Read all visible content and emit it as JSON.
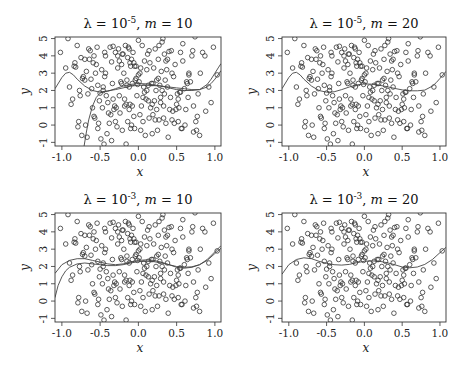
{
  "chart_data": [
    {
      "type": "scatter",
      "title": "λ = 10⁻⁵, m = 10",
      "title_parts": {
        "lambda_exp": "-5",
        "m": "10"
      },
      "xlabel": "x",
      "ylabel": "y",
      "xlim": [
        -1.09,
        1.08
      ],
      "ylim": [
        -1.21,
        5.09
      ],
      "xticks": [
        -1.0,
        -0.5,
        0.0,
        0.5,
        1.0
      ],
      "xtick_labels": [
        "-1.0",
        "-0.5",
        "0.0",
        "0.5",
        "1.0"
      ],
      "yticks": [
        -1,
        0,
        1,
        2,
        3,
        4,
        5
      ],
      "ytick_labels": [
        "-1",
        "0",
        "1",
        "2",
        "3",
        "4",
        "5"
      ],
      "grid": false,
      "curves": [
        {
          "name": "fit-a",
          "x": [
            -1.09,
            -1.0,
            -0.95,
            -0.9,
            -0.85,
            -0.8,
            -0.7,
            -0.6,
            -0.5,
            -0.4,
            -0.3,
            -0.2,
            -0.1,
            0.0,
            0.1,
            0.2,
            0.3,
            0.4,
            0.5,
            0.6,
            0.7,
            0.8,
            0.9,
            0.95,
            1.0,
            1.05,
            1.08
          ],
          "y": [
            2.1,
            2.75,
            3.0,
            3.05,
            2.9,
            2.65,
            2.25,
            2.0,
            1.9,
            1.95,
            2.1,
            2.25,
            2.35,
            2.4,
            2.38,
            2.32,
            2.25,
            2.15,
            2.05,
            2.0,
            2.0,
            2.05,
            2.35,
            2.65,
            3.0,
            3.35,
            3.55
          ]
        },
        {
          "name": "fit-b",
          "x": [
            -0.71,
            -0.68,
            -0.65,
            -0.6,
            -0.55,
            -0.5,
            -0.45,
            -0.4,
            -0.3,
            -0.2,
            -0.1,
            0.0,
            0.1,
            0.2,
            0.3,
            0.4,
            0.5,
            0.6,
            0.7,
            0.8,
            0.9,
            0.95,
            1.0,
            1.05,
            1.08
          ],
          "y": [
            -1.21,
            -0.4,
            0.3,
            1.1,
            1.6,
            1.85,
            1.95,
            1.98,
            2.05,
            2.15,
            2.25,
            2.3,
            2.3,
            2.28,
            2.25,
            2.2,
            2.15,
            2.1,
            2.05,
            2.05,
            2.2,
            2.4,
            2.65,
            2.95,
            3.15
          ]
        }
      ]
    },
    {
      "type": "scatter",
      "title": "λ = 10⁻⁵, m = 20",
      "title_parts": {
        "lambda_exp": "-5",
        "m": "20"
      },
      "xlabel": "x",
      "ylabel": "y",
      "xlim": [
        -1.09,
        1.08
      ],
      "ylim": [
        -1.21,
        5.09
      ],
      "xticks": [
        -1.0,
        -0.5,
        0.0,
        0.5,
        1.0
      ],
      "xtick_labels": [
        "-1.0",
        "-0.5",
        "0.0",
        "0.5",
        "1.0"
      ],
      "yticks": [
        -1,
        0,
        1,
        2,
        3,
        4,
        5
      ],
      "ytick_labels": [
        "-1",
        "0",
        "1",
        "2",
        "3",
        "4",
        "5"
      ],
      "grid": false,
      "curves": [
        {
          "name": "fit",
          "x": [
            -1.09,
            -1.0,
            -0.95,
            -0.9,
            -0.85,
            -0.8,
            -0.7,
            -0.6,
            -0.5,
            -0.4,
            -0.3,
            -0.2,
            -0.1,
            0.0,
            0.1,
            0.2,
            0.3,
            0.4,
            0.5,
            0.6,
            0.7,
            0.8,
            0.9,
            0.95,
            1.0,
            1.05,
            1.08
          ],
          "y": [
            2.1,
            2.75,
            3.0,
            3.05,
            2.9,
            2.65,
            2.25,
            2.0,
            1.9,
            1.92,
            2.05,
            2.2,
            2.32,
            2.38,
            2.36,
            2.3,
            2.22,
            2.12,
            2.03,
            1.98,
            1.98,
            2.02,
            2.25,
            2.45,
            2.7,
            2.95,
            3.1
          ]
        }
      ]
    },
    {
      "type": "scatter",
      "title": "λ = 10⁻³, m = 10",
      "title_parts": {
        "lambda_exp": "-3",
        "m": "10"
      },
      "xlabel": "x",
      "ylabel": "y",
      "xlim": [
        -1.09,
        1.08
      ],
      "ylim": [
        -1.21,
        5.09
      ],
      "xticks": [
        -1.0,
        -0.5,
        0.0,
        0.5,
        1.0
      ],
      "xtick_labels": [
        "-1.0",
        "-0.5",
        "0.0",
        "0.5",
        "1.0"
      ],
      "yticks": [
        -1,
        0,
        1,
        2,
        3,
        4,
        5
      ],
      "ytick_labels": [
        "-1",
        "0",
        "1",
        "2",
        "3",
        "4",
        "5"
      ],
      "grid": false,
      "curves": [
        {
          "name": "fit-a",
          "x": [
            -1.09,
            -1.0,
            -0.9,
            -0.8,
            -0.7,
            -0.6,
            -0.5,
            -0.4,
            -0.3,
            -0.2,
            -0.1,
            0.0,
            0.1,
            0.2,
            0.3,
            0.4,
            0.5,
            0.6,
            0.7,
            0.8,
            0.9,
            1.0,
            1.08
          ],
          "y": [
            1.6,
            2.1,
            2.35,
            2.45,
            2.45,
            2.35,
            2.25,
            2.15,
            2.1,
            2.15,
            2.25,
            2.35,
            2.38,
            2.35,
            2.25,
            2.1,
            1.95,
            1.9,
            1.95,
            2.1,
            2.4,
            2.85,
            3.2
          ]
        },
        {
          "name": "fit-b",
          "x": [
            -1.09,
            -1.05,
            -1.0,
            -0.95,
            -0.9,
            -0.8,
            -0.7,
            -0.6,
            -0.5,
            -0.4,
            -0.3,
            -0.2,
            -0.1,
            0.0,
            0.1,
            0.2,
            0.3,
            0.4,
            0.5,
            0.6,
            0.7,
            0.8,
            0.9,
            1.0,
            1.08
          ],
          "y": [
            0.2,
            0.9,
            1.4,
            1.75,
            1.95,
            2.15,
            2.2,
            2.15,
            2.1,
            2.05,
            2.05,
            2.1,
            2.2,
            2.28,
            2.3,
            2.28,
            2.2,
            2.1,
            2.0,
            1.95,
            1.98,
            2.1,
            2.35,
            2.75,
            3.05
          ]
        }
      ]
    },
    {
      "type": "scatter",
      "title": "λ = 10⁻³, m = 20",
      "title_parts": {
        "lambda_exp": "-3",
        "m": "20"
      },
      "xlabel": "x",
      "ylabel": "y",
      "xlim": [
        -1.09,
        1.08
      ],
      "ylim": [
        -1.21,
        5.09
      ],
      "xticks": [
        -1.0,
        -0.5,
        0.0,
        0.5,
        1.0
      ],
      "xtick_labels": [
        "-1.0",
        "-0.5",
        "0.0",
        "0.5",
        "1.0"
      ],
      "yticks": [
        -1,
        0,
        1,
        2,
        3,
        4,
        5
      ],
      "ytick_labels": [
        "-1",
        "0",
        "1",
        "2",
        "3",
        "4",
        "5"
      ],
      "grid": false,
      "curves": [
        {
          "name": "fit",
          "x": [
            -1.09,
            -1.0,
            -0.9,
            -0.8,
            -0.7,
            -0.6,
            -0.5,
            -0.4,
            -0.3,
            -0.2,
            -0.1,
            0.0,
            0.1,
            0.2,
            0.3,
            0.4,
            0.5,
            0.6,
            0.7,
            0.8,
            0.9,
            1.0,
            1.08
          ],
          "y": [
            1.55,
            2.1,
            2.4,
            2.5,
            2.45,
            2.3,
            2.18,
            2.1,
            2.08,
            2.12,
            2.22,
            2.3,
            2.32,
            2.3,
            2.22,
            2.1,
            1.97,
            1.92,
            1.97,
            2.12,
            2.4,
            2.8,
            3.1
          ]
        }
      ]
    }
  ],
  "shared_points": {
    "x": [
      -1.02,
      -0.92,
      -0.9,
      -0.88,
      -0.86,
      -0.84,
      -0.82,
      -0.8,
      -0.79,
      -0.78,
      -0.76,
      -0.75,
      -0.74,
      -0.72,
      -0.7,
      -0.7,
      -0.69,
      -0.67,
      -0.66,
      -0.65,
      -0.62,
      -0.6,
      -0.59,
      -0.58,
      -0.57,
      -0.56,
      -0.55,
      -0.54,
      -0.53,
      -0.52,
      -0.5,
      -0.48,
      -0.47,
      -0.46,
      -0.45,
      -0.44,
      -0.43,
      -0.42,
      -0.41,
      -0.4,
      -0.38,
      -0.37,
      -0.35,
      -0.34,
      -0.33,
      -0.32,
      -0.31,
      -0.3,
      -0.29,
      -0.28,
      -0.27,
      -0.26,
      -0.25,
      -0.24,
      -0.23,
      -0.22,
      -0.21,
      -0.2,
      -0.19,
      -0.18,
      -0.17,
      -0.16,
      -0.15,
      -0.15,
      -0.14,
      -0.14,
      -0.13,
      -0.12,
      -0.12,
      -0.11,
      -0.1,
      -0.1,
      -0.09,
      -0.08,
      -0.08,
      -0.07,
      -0.06,
      -0.06,
      -0.05,
      -0.04,
      -0.03,
      -0.02,
      -0.01,
      0.0,
      0.01,
      0.02,
      0.03,
      0.04,
      0.05,
      0.06,
      0.07,
      0.08,
      0.09,
      0.1,
      0.11,
      0.12,
      0.13,
      0.14,
      0.15,
      0.16,
      0.17,
      0.18,
      0.19,
      0.2,
      0.21,
      0.22,
      0.23,
      0.24,
      0.25,
      0.26,
      0.27,
      0.28,
      0.29,
      0.3,
      0.31,
      0.32,
      0.33,
      0.34,
      0.35,
      0.36,
      0.37,
      0.38,
      0.39,
      0.4,
      0.42,
      0.44,
      0.46,
      0.48,
      0.5,
      0.52,
      0.53,
      0.55,
      0.56,
      0.58,
      0.6,
      0.62,
      0.64,
      0.66,
      0.68,
      0.7,
      0.72,
      0.74,
      0.76,
      0.78,
      0.8,
      0.84,
      0.88,
      0.92,
      0.95,
      0.98,
      1.03,
      -0.95,
      -0.83,
      -0.77,
      -0.63,
      -0.51,
      -0.36,
      -0.27,
      -0.18,
      -0.05,
      0.08,
      0.18,
      0.27,
      0.36,
      0.45,
      0.54,
      0.63,
      0.72,
      0.81,
      -0.68,
      -0.58,
      -0.44,
      -0.33,
      -0.21,
      -0.09,
      0.03,
      0.14,
      0.24,
      0.33,
      0.43,
      0.51,
      0.58,
      0.66,
      0.75,
      -0.49,
      -0.39,
      -0.25,
      -0.12,
      0.0,
      0.11,
      0.22,
      0.31,
      0.41,
      0.49,
      0.57,
      -0.61,
      -0.53,
      -0.43,
      -0.3,
      -0.16,
      -0.03,
      0.06,
      0.19,
      0.29,
      0.38,
      0.47,
      0.55,
      0.65,
      0.77,
      0.87,
      -0.73,
      -0.64,
      -0.46,
      -0.35,
      -0.22,
      -0.11,
      0.02,
      0.13,
      0.26,
      0.34,
      0.44,
      0.52,
      0.61,
      0.71
    ],
    "y": [
      4.2,
      5.0,
      2.2,
      1.2,
      1.5,
      3.4,
      3.35,
      4.6,
      -0.1,
      0.2,
      1.7,
      3.9,
      -0.6,
      2.8,
      2.6,
      3.8,
      0.0,
      -0.7,
      1.8,
      4.4,
      2.65,
      1.0,
      3.6,
      4.0,
      0.4,
      3.0,
      3.5,
      4.5,
      -0.2,
      0.1,
      1.85,
      3.2,
      1.0,
      2.0,
      -1.1,
      4.2,
      3.0,
      1.7,
      -0.5,
      1.3,
      0.1,
      4.5,
      3.65,
      2.4,
      4.55,
      0.9,
      1.1,
      4.2,
      1.0,
      -0.1,
      3.3,
      4.4,
      1.7,
      0.7,
      2.5,
      3.5,
      -0.3,
      4.1,
      3.0,
      1.1,
      4.6,
      -1.1,
      2.3,
      2.6,
      0.2,
      3.9,
      4.5,
      0.9,
      2.2,
      1.2,
      3.4,
      -0.2,
      3.8,
      2.4,
      1.1,
      4.2,
      3.6,
      0.5,
      -0.2,
      2.6,
      3.4,
      1.7,
      2.35,
      4.9,
      2.5,
      3.0,
      -0.3,
      1.1,
      4.6,
      0.2,
      2.2,
      3.7,
      -0.6,
      1.5,
      2.0,
      4.1,
      2.3,
      0.4,
      3.6,
      1.0,
      2.4,
      -0.5,
      0.6,
      3.3,
      1.4,
      4.4,
      2.0,
      0.9,
      -0.3,
      2.7,
      4.6,
      2.3,
      1.3,
      3.1,
      4.8,
      5.0,
      0.4,
      1.8,
      2.6,
      0.1,
      3.2,
      2.2,
      -0.7,
      4.25,
      1.6,
      0.3,
      2.8,
      3.5,
      1.2,
      0.2,
      1.0,
      4.2,
      -0.2,
      3.7,
      2.1,
      0.9,
      2.4,
      3.0,
      2.5,
      4.0,
      1.1,
      5.1,
      -0.3,
      1.8,
      -0.6,
      4.2,
      0.8,
      2.2,
      1.3,
      4.5,
      2.9,
      3.3,
      3.6,
      2.0,
      4.3,
      1.4,
      0.6,
      4.0,
      1.5,
      3.4,
      1.9,
      1.2,
      0.3,
      3.7,
      0.8,
      1.9,
      2.5,
      -0.4,
      3.0,
      3.1,
      0.5,
      2.8,
      1.5,
      4.1,
      0.0,
      3.3,
      4.3,
      2.6,
      1.1,
      4.3,
      1.8,
      4.7,
      2.9,
      0.2,
      -0.8,
      0.7,
      3.7,
      4.4,
      2.9,
      3.2,
      0.3,
      2.0,
      0.9,
      0.9,
      -0.2,
      2.1,
      2.3,
      4.0,
      0.2,
      1.2,
      2.7,
      1.6,
      2.4,
      1.6,
      3.8,
      0.1,
      1.9,
      1.6,
      0.5,
      4.0,
      2.7,
      3.8,
      2.2,
      -0.9,
      2.4,
      3.6,
      0.6,
      1.4,
      3.8,
      4.1,
      3.0,
      1.5,
      0.0,
      4.3,
      2.1,
      0.7,
      1.0
    ]
  }
}
